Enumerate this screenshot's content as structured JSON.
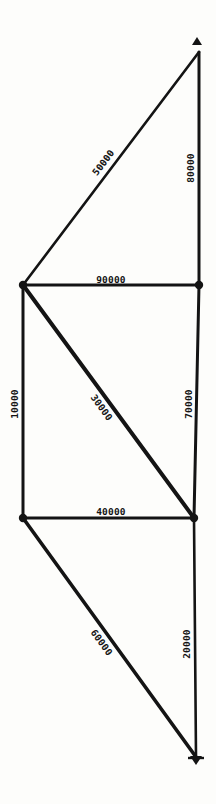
{
  "page": {
    "background": "#fdfdfb",
    "ink": "#141414"
  },
  "diagram": {
    "type": "graph",
    "nodes": [
      {
        "id": "top",
        "x": 199,
        "y": 52,
        "dot": false
      },
      {
        "id": "upper-left",
        "x": 23,
        "y": 285,
        "dot": true
      },
      {
        "id": "upper-right",
        "x": 199,
        "y": 285,
        "dot": true
      },
      {
        "id": "lower-left",
        "x": 23,
        "y": 518,
        "dot": true
      },
      {
        "id": "lower-right",
        "x": 194,
        "y": 518,
        "dot": true
      },
      {
        "id": "bottom",
        "x": 196,
        "y": 757,
        "dot": false
      }
    ],
    "edges": [
      {
        "from": "top",
        "to": "upper-left",
        "label": "50000",
        "lx": 104,
        "ly": 163,
        "rot": -53,
        "w": 2.6
      },
      {
        "from": "top",
        "to": "upper-right",
        "label": "80000",
        "lx": 191,
        "ly": 168,
        "rot": -90,
        "w": 3.0
      },
      {
        "from": "upper-left",
        "to": "upper-right",
        "label": "90000",
        "lx": 111,
        "ly": 280,
        "rot": 0,
        "w": 3.2
      },
      {
        "from": "upper-left",
        "to": "lower-left",
        "label": "10000",
        "lx": 15,
        "ly": 404,
        "rot": -90,
        "w": 3.0
      },
      {
        "from": "upper-left",
        "to": "lower-right",
        "label": "30000",
        "lx": 101,
        "ly": 408,
        "rot": 54,
        "w": 4.0
      },
      {
        "from": "upper-right",
        "to": "lower-right",
        "label": "70000",
        "lx": 189,
        "ly": 404,
        "rot": -90,
        "w": 3.0
      },
      {
        "from": "lower-left",
        "to": "lower-right",
        "label": "40000",
        "lx": 111,
        "ly": 512,
        "rot": 0,
        "w": 3.2
      },
      {
        "from": "lower-left",
        "to": "bottom",
        "label": "60000",
        "lx": 101,
        "ly": 643,
        "rot": 54,
        "w": 3.6
      },
      {
        "from": "lower-right",
        "to": "bottom",
        "label": "20000",
        "lx": 187,
        "ly": 644,
        "rot": -90,
        "w": 2.6
      }
    ],
    "arrows": [
      {
        "at": "top",
        "dir": "up",
        "x": 197,
        "y": 42
      },
      {
        "at": "bottom",
        "dir": "down",
        "x": 196,
        "y": 760
      }
    ],
    "node_radius": 4.2
  }
}
